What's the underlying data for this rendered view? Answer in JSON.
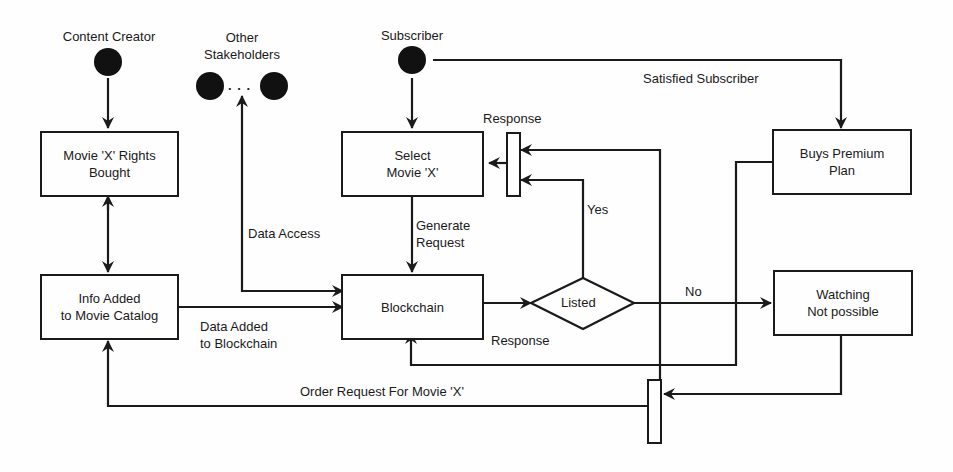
{
  "actors": {
    "content_creator": "Content Creator",
    "other_stakeholders": "Other\nStakeholders",
    "stakeholders_ellipsis": ". . .",
    "subscriber": "Subscriber"
  },
  "nodes": {
    "rights_bought": "Movie 'X' Rights\nBought",
    "info_added": "Info Added\nto Movie Catalog",
    "select_movie": "Select\nMovie 'X'",
    "blockchain": "Blockchain",
    "listed": "Listed",
    "buys_premium": "Buys Premium\nPlan",
    "watching_not_possible": "Watching\nNot possible"
  },
  "edges": {
    "satisfied_subscriber": "Satisfied Subscriber",
    "response_top": "Response",
    "yes": "Yes",
    "generate_request": "Generate\nRequest",
    "data_access": "Data Access",
    "data_added": "Data Added\nto Blockchain",
    "response_bottom": "Response",
    "no": "No",
    "order_request": "Order Request For Movie 'X'"
  }
}
